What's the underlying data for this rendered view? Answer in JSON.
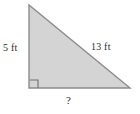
{
  "figure": {
    "type": "right-triangle-diagram",
    "background_color": "#ffffff",
    "fill_color": "#d4d4d4",
    "stroke_color": "#8c8c8c",
    "label_color": "#2b2b2b",
    "vertices": {
      "top_left": [
        29,
        5
      ],
      "bottom_left": [
        29,
        88
      ],
      "bottom_right": [
        130,
        88
      ]
    },
    "right_angle_marker": {
      "name": "right-angle-marker",
      "corner": "bottom-left",
      "size": 8
    },
    "labels": {
      "vertical_leg": "5 ft",
      "hypotenuse": "13 ft",
      "horizontal_leg": "?"
    }
  }
}
